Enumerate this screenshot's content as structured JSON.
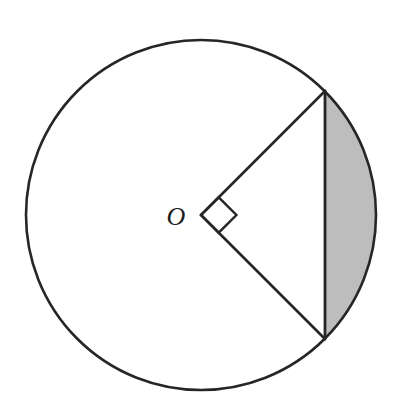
{
  "figure": {
    "background_color": "#ffffff",
    "stroke_color": "#262626",
    "shaded_fill_color": "#bdbdbd",
    "labels": {
      "center_point": "O"
    },
    "geometry": {
      "circle": {
        "name": "main-circle",
        "center_x": 201,
        "center_y": 215,
        "radius": 175,
        "stroke_width": 2.6,
        "fill": "none"
      },
      "radii": [
        {
          "name": "upper-radius",
          "from_x": 201,
          "from_y": 215,
          "to_x": 325,
          "to_y": 91,
          "angle_degrees": 45,
          "stroke_width": 2.6
        },
        {
          "name": "lower-radius",
          "from_x": 201,
          "from_y": 215,
          "to_x": 325,
          "to_y": 339,
          "angle_degrees": -45,
          "stroke_width": 2.6
        }
      ],
      "chord": {
        "name": "vertical-chord",
        "from_x": 325,
        "from_y": 91,
        "to_x": 325,
        "to_y": 339,
        "stroke_width": 2.8
      },
      "shaded_segment": {
        "name": "circular-segment",
        "path": "M 325 91 A 175 175 0 0 1 325 339 L 325 91 Z",
        "description": "Region bounded by the chord and the minor arc on the right side"
      },
      "right_angle_marker": {
        "name": "right-angle-square",
        "vertex_x": 201,
        "vertex_y": 215,
        "arm_length": 25,
        "points": "201,215 218.7,197.3 236.4,215 218.7,232.7",
        "stroke_width": 2.4,
        "angle_degrees": 90
      },
      "center_label_position": {
        "x": 176,
        "y": 225,
        "font_size": 26
      }
    }
  }
}
